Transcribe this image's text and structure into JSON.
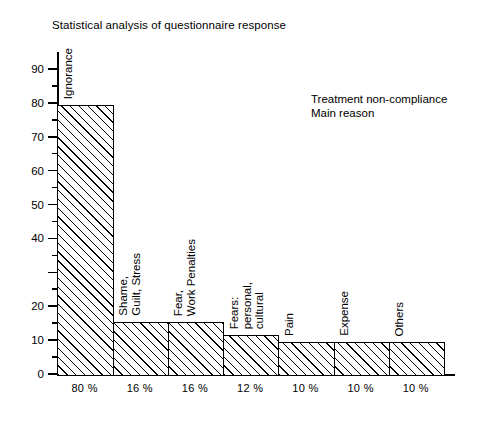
{
  "chart_data": {
    "type": "bar",
    "title": "Statistical analysis of questionnaire response",
    "subtitle": "",
    "xlabel": "",
    "ylabel": "",
    "ylim": [
      0,
      95
    ],
    "grid": false,
    "legend": null,
    "annotations": [
      "Treatment non-compliance",
      "Main reason"
    ],
    "categories": [
      "Ignorance",
      "Shame, Guilt, Stress",
      "Fear, Work Penalties",
      "Fears: personal, cultural",
      "Pain",
      "Expense",
      "Others"
    ],
    "values": [
      80,
      16,
      16,
      12,
      10,
      10,
      10
    ],
    "tick_labels": [
      "80 %",
      "16 %",
      "16 %",
      "12 %",
      "10 %",
      "10 %",
      "10 %"
    ],
    "bar_labels": [
      [
        "Ignorance"
      ],
      [
        "Shame,",
        "Guilt, Stress"
      ],
      [
        "Fear,",
        "Work Penalties"
      ],
      [
        "Fears:",
        "personal,",
        "cultural"
      ],
      [
        "Pain"
      ],
      [
        "Expense"
      ],
      [
        "Others"
      ]
    ],
    "y_major_ticks": [
      0,
      10,
      20,
      30,
      40,
      50,
      60,
      70,
      80,
      90
    ],
    "y_major_tick_labels": [
      "0",
      "10",
      "20",
      "",
      "40",
      "50",
      "60",
      "70",
      "80",
      "90"
    ],
    "y_minor_ticks": [
      5,
      15,
      25,
      35,
      45,
      55,
      65,
      75,
      85
    ],
    "colors": {
      "axis": "#000000",
      "bar_edge": "#000000",
      "bar_fill": "#ffffff",
      "hatch": "#000000",
      "text": "#000000",
      "background": "#ffffff"
    }
  }
}
